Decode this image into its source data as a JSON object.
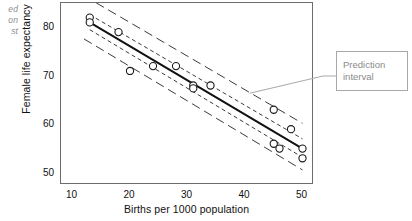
{
  "margin_note": {
    "text": "ed\non\nst"
  },
  "chart_data": {
    "type": "scatter",
    "title": "",
    "xlabel": "Births per 1000 population",
    "ylabel": "Female life expectancy",
    "xlim": [
      8,
      52
    ],
    "ylim": [
      47.5,
      85
    ],
    "xticks": [
      10,
      20,
      30,
      40,
      50
    ],
    "yticks": [
      50,
      60,
      70,
      80
    ],
    "grid": false,
    "legend": null,
    "points": [
      {
        "x": 13,
        "y": 82
      },
      {
        "x": 13,
        "y": 81
      },
      {
        "x": 18,
        "y": 79
      },
      {
        "x": 20,
        "y": 71
      },
      {
        "x": 24,
        "y": 72
      },
      {
        "x": 28,
        "y": 72
      },
      {
        "x": 31,
        "y": 68
      },
      {
        "x": 31,
        "y": 67.4
      },
      {
        "x": 34,
        "y": 68
      },
      {
        "x": 45,
        "y": 63
      },
      {
        "x": 45,
        "y": 56
      },
      {
        "x": 46,
        "y": 55
      },
      {
        "x": 48,
        "y": 59
      },
      {
        "x": 50,
        "y": 55
      },
      {
        "x": 50,
        "y": 53
      }
    ],
    "series": [
      {
        "name": "Fitted regression line",
        "style": "solid",
        "x": [
          13,
          50
        ],
        "values": [
          81.0,
          55.0
        ]
      },
      {
        "name": "Confidence interval upper",
        "style": "short-dashed",
        "x": [
          13,
          50
        ],
        "values": [
          82.6,
          57.0
        ]
      },
      {
        "name": "Confidence interval lower",
        "style": "short-dashed",
        "x": [
          13,
          50
        ],
        "values": [
          79.5,
          53.2
        ]
      },
      {
        "name": "Prediction interval upper",
        "style": "long-dashed",
        "x": [
          12,
          50
        ],
        "values": [
          86.5,
          60.2
        ]
      },
      {
        "name": "Prediction interval lower",
        "style": "long-dashed",
        "x": [
          12,
          50
        ],
        "values": [
          77.6,
          50.6
        ]
      }
    ],
    "annotations": [
      {
        "label": "Prediction interval",
        "label_line1": "Prediction",
        "label_line2": "interval",
        "target_x": 41,
        "target_y": 66.2
      }
    ],
    "colors": {
      "fit_line": "#111111",
      "interval_line": "#3a3a3a",
      "marker_edge": "#1a1a1a",
      "marker_fill": "#ffffff",
      "frame": "#6d6d6d",
      "annotation_text": "#8a8a8a",
      "annotation_border": "#a8a8a8",
      "margin_note": "#8d8d8d"
    }
  }
}
